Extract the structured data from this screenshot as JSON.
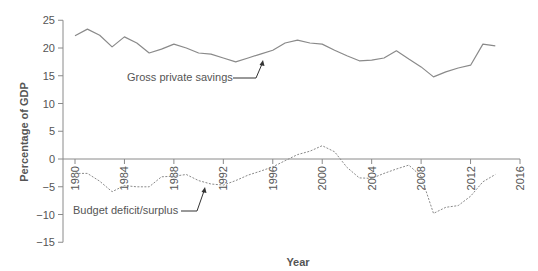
{
  "chart_data": {
    "type": "line",
    "title": "",
    "xlabel": "Year",
    "ylabel": "Percentage of GDP",
    "xlim": [
      1979,
      2016
    ],
    "ylim": [
      -15,
      25
    ],
    "x_ticks": [
      1980,
      1984,
      1988,
      1992,
      1996,
      2000,
      2004,
      2008,
      2012,
      2016
    ],
    "y_ticks": [
      25,
      20,
      15,
      10,
      5,
      0,
      -5,
      -10,
      -15
    ],
    "grid": false,
    "legend": "inline annotations with arrows",
    "x": [
      1980,
      1981,
      1982,
      1983,
      1984,
      1985,
      1986,
      1987,
      1988,
      1989,
      1990,
      1991,
      1992,
      1993,
      1994,
      1995,
      1996,
      1997,
      1998,
      1999,
      2000,
      2001,
      2002,
      2003,
      2004,
      2005,
      2006,
      2007,
      2008,
      2009,
      2010,
      2011,
      2012,
      2013,
      2014
    ],
    "series": [
      {
        "name": "Gross private savings",
        "style": "solid",
        "color": "#8a8a8a",
        "values": [
          22.2,
          23.4,
          22.3,
          20.2,
          22.0,
          20.9,
          19.1,
          19.8,
          20.7,
          20.0,
          19.1,
          18.9,
          18.2,
          17.5,
          18.2,
          18.9,
          19.6,
          20.9,
          21.4,
          20.9,
          20.7,
          19.6,
          18.6,
          17.7,
          17.8,
          18.2,
          19.5,
          18.0,
          16.6,
          14.8,
          15.7,
          16.4,
          16.9,
          20.7,
          20.4
        ]
      },
      {
        "name": "Budget deficit/surplus",
        "style": "dashed",
        "color": "#8a8a8a",
        "values": [
          -2.6,
          -2.6,
          -4.0,
          -5.9,
          -4.8,
          -5.0,
          -5.0,
          -3.2,
          -3.1,
          -2.8,
          -3.9,
          -4.5,
          -4.7,
          -3.9,
          -2.9,
          -2.2,
          -1.4,
          -0.3,
          0.8,
          1.4,
          2.4,
          1.3,
          -1.5,
          -3.4,
          -3.5,
          -2.6,
          -1.8,
          -1.1,
          -3.1,
          -9.8,
          -8.7,
          -8.4,
          -6.7,
          -4.1,
          -2.8
        ]
      }
    ],
    "annotations": [
      {
        "text": "Gross private savings",
        "points_to_year": 1995,
        "series": "Gross private savings"
      },
      {
        "text": "Budget deficit/surplus",
        "points_to_year": 1991,
        "series": "Budget deficit/surplus"
      }
    ]
  },
  "labels": {
    "ylabel": "Percentage of GDP",
    "xlabel": "Year",
    "annot_savings": "Gross private savings",
    "annot_budget": "Budget deficit/surplus"
  },
  "colors": {
    "axis": "#8a8a8a",
    "line": "#8a8a8a",
    "text": "#555555",
    "arrow": "#333333"
  }
}
